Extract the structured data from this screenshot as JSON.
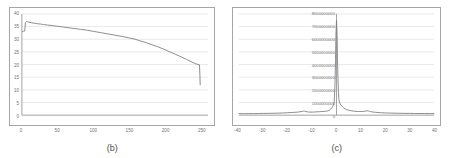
{
  "figure": {
    "panels": [
      {
        "caption": "(b)",
        "name": "panel-b"
      },
      {
        "caption": "(c)",
        "name": "panel-c"
      }
    ],
    "colors": {
      "data_line": "#808080",
      "gridline": "#d9d9d9",
      "axis": "#8c8c8c",
      "frame": "#a6a6a6",
      "background": "#ffffff",
      "tick_text": "#737373"
    }
  },
  "chart_data": [
    {
      "type": "line",
      "panel": "b",
      "title": "",
      "caption": "(b)",
      "xlabel": "",
      "ylabel": "",
      "xlim": [
        0,
        260
      ],
      "ylim": [
        0,
        40
      ],
      "grid": true,
      "grid_axis": "y",
      "legend": "none",
      "xticks": [
        0,
        50,
        100,
        150,
        200,
        250
      ],
      "xtick_labels": [
        "0",
        "50",
        "100",
        "150",
        "200",
        "250"
      ],
      "yticks": [
        0,
        5,
        10,
        15,
        20,
        25,
        30,
        35,
        40
      ],
      "ytick_labels": [
        "0",
        "5",
        "10",
        "15",
        "20",
        "25",
        "30",
        "35",
        "40"
      ],
      "series": [
        {
          "name": "capacity-fade-curve",
          "x": [
            0,
            1,
            2,
            3,
            4,
            5,
            6,
            7,
            8,
            10,
            14,
            18,
            22,
            26,
            30,
            36,
            42,
            50,
            58,
            66,
            74,
            82,
            90,
            100,
            110,
            120,
            130,
            140,
            150,
            158,
            166,
            174,
            182,
            190,
            198,
            206,
            214,
            222,
            230,
            236,
            242,
            246,
            248,
            248.6,
            249
          ],
          "y": [
            33.2,
            33.0,
            33.1,
            33.3,
            33.2,
            36.6,
            36.9,
            37.0,
            36.9,
            36.7,
            36.5,
            36.3,
            36.1,
            36.0,
            35.8,
            35.6,
            35.4,
            35.1,
            34.8,
            34.5,
            34.2,
            33.9,
            33.6,
            33.1,
            32.6,
            32.1,
            31.6,
            31.1,
            30.5,
            30.0,
            29.3,
            28.6,
            27.8,
            27.0,
            26.1,
            25.1,
            24.1,
            23.1,
            22.0,
            21.2,
            20.4,
            20.0,
            19.9,
            16.0,
            12.0
          ]
        }
      ]
    },
    {
      "type": "line",
      "panel": "c",
      "title": "",
      "caption": "(c)",
      "xlabel": "",
      "ylabel": "",
      "xlim": [
        -40,
        40
      ],
      "ylim": [
        0,
        8000000000
      ],
      "grid": true,
      "grid_axis": "y",
      "legend": "none",
      "xticks": [
        -40,
        -30,
        -20,
        -10,
        0,
        10,
        20,
        30,
        40
      ],
      "xtick_labels": [
        "-40",
        "-30",
        "-20",
        "-10",
        "0",
        "10",
        "20",
        "30",
        "40"
      ],
      "yticks": [
        0,
        1000000000,
        2000000000,
        3000000000,
        4000000000,
        5000000000,
        6000000000,
        7000000000,
        8000000000
      ],
      "ytick_labels": [
        "0",
        "1000000000",
        "2000000000",
        "3000000000",
        "4000000000",
        "5000000000",
        "6000000000",
        "7000000000",
        "8000000000"
      ],
      "series": [
        {
          "name": "correlation-peak",
          "x": [
            -40,
            -38,
            -36,
            -34,
            -32,
            -30,
            -28,
            -26,
            -24,
            -22,
            -20,
            -18,
            -16,
            -15,
            -14,
            -13.5,
            -13,
            -12.5,
            -12,
            -11,
            -10,
            -9,
            -8,
            -7,
            -6,
            -5,
            -4,
            -3.5,
            -3,
            -2.5,
            -2,
            -1.5,
            -1.2,
            -1,
            -0.8,
            -0.6,
            -0.4,
            -0.25,
            0,
            0.25,
            0.4,
            0.6,
            0.8,
            1,
            1.2,
            1.5,
            2,
            2.5,
            3,
            3.5,
            4,
            5,
            6,
            7,
            8,
            9,
            10,
            11,
            12,
            12.5,
            13,
            13.5,
            14,
            15,
            16,
            18,
            20,
            22,
            24,
            26,
            28,
            30,
            32,
            34,
            36,
            38,
            40
          ],
          "y": [
            120000000,
            118000000,
            122000000,
            125000000,
            130000000,
            140000000,
            145000000,
            150000000,
            160000000,
            175000000,
            195000000,
            215000000,
            240000000,
            265000000,
            300000000,
            320000000,
            310000000,
            285000000,
            260000000,
            245000000,
            240000000,
            250000000,
            265000000,
            275000000,
            290000000,
            300000000,
            320000000,
            340000000,
            380000000,
            450000000,
            560000000,
            700000000,
            860000000,
            1000000000,
            1500000000,
            2600000000,
            4300000000,
            6200000000,
            7500000000,
            6300000000,
            4500000000,
            2900000000,
            1800000000,
            1250000000,
            1050000000,
            900000000,
            760000000,
            650000000,
            560000000,
            500000000,
            450000000,
            390000000,
            350000000,
            320000000,
            300000000,
            290000000,
            285000000,
            295000000,
            330000000,
            345000000,
            330000000,
            305000000,
            280000000,
            245000000,
            225000000,
            195000000,
            175000000,
            165000000,
            155000000,
            148000000,
            142000000,
            138000000,
            133000000,
            130000000,
            126000000,
            124000000,
            122000000
          ]
        }
      ]
    }
  ]
}
